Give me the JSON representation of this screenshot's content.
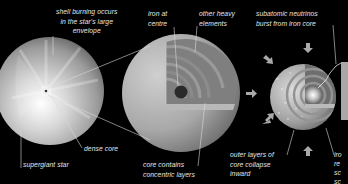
{
  "diagram": {
    "type": "illustrated-process",
    "background_color": "#000000",
    "stages": [
      {
        "id": "supergiant",
        "name": "supergiant star",
        "labels": {
          "top": [
            "shell burning occurs",
            "in the star's large",
            "envelope"
          ],
          "core": "dense core",
          "bottom": "supergiant star"
        }
      },
      {
        "id": "core-cutaway",
        "name": "core cutaway",
        "labels": {
          "iron": [
            "iron at",
            "centre"
          ],
          "heavy": [
            "other heavy",
            "elements"
          ],
          "bottom": [
            "core contains",
            "concentric layers"
          ]
        }
      },
      {
        "id": "collapse",
        "name": "core collapse",
        "labels": {
          "top": [
            "subatomic neutrinos",
            "burst from iron core"
          ],
          "bottom": [
            "outer layers of",
            "core collapse",
            "inward"
          ],
          "right_cut": [
            "iro",
            "re",
            "sc",
            "sc"
          ]
        },
        "arrows": [
          "down",
          "down-right",
          "right",
          "up-right",
          "up"
        ]
      }
    ],
    "colors": {
      "star_light": "#f2f2f2",
      "star_mid": "#b5b5b5",
      "star_dark": "#6a6a6a",
      "label_text": "#e6e6e6",
      "leader_line": "#d8d8d8",
      "arrow": "#a9a9a9"
    }
  }
}
